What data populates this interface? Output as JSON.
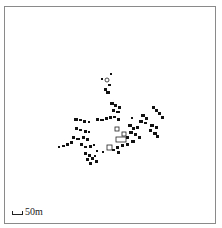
{
  "map": {
    "scale_bar": {
      "label": "50m"
    },
    "colors": {
      "building": "#111111",
      "outline": "#222222",
      "frame": "#8a8a8a",
      "background": "#ffffff"
    },
    "buildings_filled": [
      [
        110,
        73,
        2,
        2
      ],
      [
        101,
        78,
        2,
        2
      ],
      [
        108,
        84,
        3,
        2
      ],
      [
        104,
        88,
        3,
        3
      ],
      [
        106,
        91,
        4,
        3
      ],
      [
        110,
        102,
        4,
        3
      ],
      [
        114,
        104,
        3,
        3
      ],
      [
        118,
        106,
        3,
        3
      ],
      [
        112,
        109,
        3,
        3
      ],
      [
        116,
        111,
        4,
        2
      ],
      [
        74,
        118,
        4,
        3
      ],
      [
        79,
        119,
        3,
        2
      ],
      [
        83,
        120,
        3,
        3
      ],
      [
        88,
        121,
        2,
        2
      ],
      [
        96,
        118,
        3,
        3
      ],
      [
        100,
        119,
        4,
        2
      ],
      [
        105,
        117,
        3,
        3
      ],
      [
        109,
        116,
        3,
        3
      ],
      [
        113,
        116,
        3,
        2
      ],
      [
        117,
        118,
        3,
        3
      ],
      [
        131,
        117,
        2,
        2
      ],
      [
        141,
        114,
        4,
        3
      ],
      [
        145,
        117,
        3,
        3
      ],
      [
        139,
        120,
        4,
        3
      ],
      [
        144,
        122,
        3,
        2
      ],
      [
        152,
        106,
        3,
        3
      ],
      [
        155,
        109,
        3,
        3
      ],
      [
        158,
        112,
        3,
        3
      ],
      [
        161,
        116,
        3,
        3
      ],
      [
        150,
        124,
        4,
        3
      ],
      [
        155,
        126,
        3,
        3
      ],
      [
        149,
        129,
        3,
        3
      ],
      [
        153,
        132,
        4,
        3
      ],
      [
        156,
        135,
        3,
        3
      ],
      [
        75,
        127,
        3,
        3
      ],
      [
        79,
        129,
        3,
        2
      ],
      [
        84,
        130,
        3,
        3
      ],
      [
        88,
        131,
        2,
        2
      ],
      [
        72,
        136,
        3,
        3
      ],
      [
        76,
        138,
        4,
        2
      ],
      [
        82,
        136,
        3,
        3
      ],
      [
        86,
        138,
        3,
        3
      ],
      [
        58,
        146,
        2,
        2
      ],
      [
        62,
        145,
        3,
        2
      ],
      [
        66,
        143,
        3,
        3
      ],
      [
        70,
        141,
        3,
        3
      ],
      [
        80,
        143,
        3,
        3
      ],
      [
        84,
        146,
        3,
        2
      ],
      [
        89,
        145,
        3,
        3
      ],
      [
        93,
        144,
        2,
        2
      ],
      [
        128,
        124,
        4,
        3
      ],
      [
        132,
        127,
        3,
        3
      ],
      [
        136,
        126,
        3,
        3
      ],
      [
        129,
        131,
        4,
        3
      ],
      [
        134,
        133,
        3,
        3
      ],
      [
        138,
        136,
        3,
        3
      ],
      [
        126,
        136,
        3,
        3
      ],
      [
        131,
        140,
        4,
        3
      ],
      [
        126,
        143,
        3,
        3
      ],
      [
        121,
        144,
        3,
        3
      ],
      [
        116,
        146,
        3,
        3
      ],
      [
        112,
        149,
        3,
        2
      ],
      [
        117,
        151,
        3,
        3
      ],
      [
        84,
        152,
        3,
        3
      ],
      [
        88,
        154,
        3,
        3
      ],
      [
        86,
        158,
        3,
        3
      ],
      [
        91,
        157,
        3,
        3
      ],
      [
        94,
        155,
        2,
        2
      ],
      [
        95,
        160,
        3,
        3
      ],
      [
        89,
        162,
        3,
        3
      ],
      [
        96,
        150,
        2,
        2
      ],
      [
        102,
        151,
        2,
        2
      ]
    ],
    "buildings_outline": [
      [
        115,
        127,
        4,
        4
      ],
      [
        116,
        137,
        10,
        5
      ],
      [
        122,
        132,
        4,
        4
      ],
      [
        107,
        145,
        5,
        5
      ]
    ],
    "small_circles": [
      [
        107,
        80,
        2
      ]
    ]
  }
}
